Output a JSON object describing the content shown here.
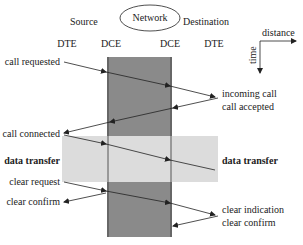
{
  "header": {
    "source": "Source",
    "network": "Network",
    "destination": "Destination"
  },
  "columns": [
    "DTE",
    "DCE",
    "DCE",
    "DTE"
  ],
  "axes": {
    "distance": "distance",
    "time": "time"
  },
  "source_events": {
    "call_requested": "call requested",
    "call_connected": "call connected",
    "data_transfer": "data transfer",
    "clear_request": "clear request",
    "clear_confirm": "clear confirm"
  },
  "destination_events": {
    "incoming_call": "incoming call",
    "call_accepted": "call accepted",
    "data_transfer": "data transfer",
    "clear_indication": "clear indication",
    "clear_confirm": "clear confirm"
  },
  "colors": {
    "network_dark": "#8a8a8a",
    "data_band": "#dcdcdc",
    "line": "#333333"
  }
}
